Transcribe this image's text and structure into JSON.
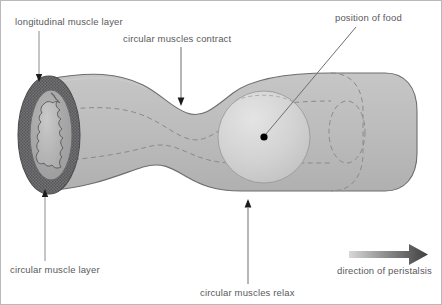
{
  "figure": {
    "background_color": "#ffffff",
    "border_color": "#b9b9b9"
  },
  "labels": {
    "longitudinal_muscle_layer": "longitudinal muscle layer",
    "circular_muscles_contract": "circular muscles contract",
    "position_of_food": "position of food",
    "circular_muscle_layer": "circular muscle layer",
    "circular_muscles_relax": "circular muscles relax",
    "direction_of_peristalsis": "direction of peristalsis"
  },
  "colors": {
    "label_text": "#59595b",
    "leader_line": "#7d7d80",
    "tube_fill": "#bcbcbc",
    "tube_outline": "#6e6e70",
    "lumen_dashed": "#8a8a8c",
    "longitudinal_ring": "#6b6b6d",
    "circular_ring": "#a6a6a8",
    "bolus_fill": "#d6d6d6",
    "arrow_dark": "#4a4a4c",
    "food_marker": "#000000"
  },
  "elements": {
    "tube": "gut-tube-with-constriction",
    "cross_section": "cut-end-cross-section",
    "bolus": "food-bolus-sphere",
    "peristalsis_arrow": "right-pointing-gradient-arrow",
    "food_marker": "black-dot-marker"
  }
}
